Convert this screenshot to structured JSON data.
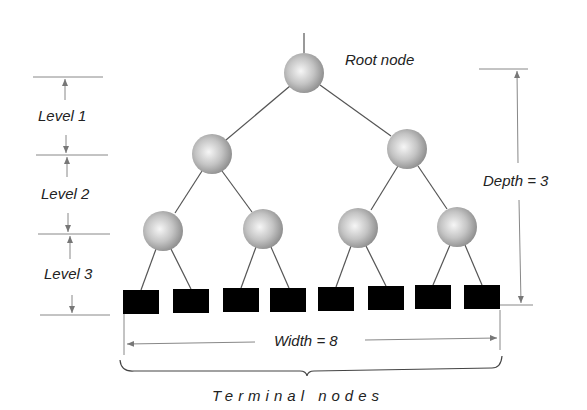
{
  "diagram": {
    "type": "binary-tree",
    "labels": {
      "root": "Root node",
      "level1": "Level 1",
      "level2": "Level 2",
      "level3": "Level 3",
      "depth": "Depth = 3",
      "width": "Width = 8",
      "terminal": "Terminal nodes"
    },
    "colors": {
      "line": "#555555",
      "node_fill_light": "#f4f4f4",
      "node_fill_dark": "#9a9a9a",
      "terminal_fill": "#000000",
      "guide": "#888888"
    },
    "nodes": [
      {
        "id": "root",
        "level": 0,
        "cx": 304,
        "cy": 73
      },
      {
        "id": "n1L",
        "level": 1,
        "cx": 212,
        "cy": 154
      },
      {
        "id": "n1R",
        "level": 1,
        "cx": 407,
        "cy": 149
      },
      {
        "id": "n2a",
        "level": 2,
        "cx": 163,
        "cy": 231
      },
      {
        "id": "n2b",
        "level": 2,
        "cx": 263,
        "cy": 229
      },
      {
        "id": "n2c",
        "level": 2,
        "cx": 358,
        "cy": 228
      },
      {
        "id": "n2d",
        "level": 2,
        "cx": 457,
        "cy": 227
      }
    ],
    "terminal_nodes": [
      {
        "x": 123,
        "y": 290
      },
      {
        "x": 173,
        "y": 289
      },
      {
        "x": 223,
        "y": 288
      },
      {
        "x": 270,
        "y": 288
      },
      {
        "x": 318,
        "y": 287
      },
      {
        "x": 368,
        "y": 286
      },
      {
        "x": 415,
        "y": 285
      },
      {
        "x": 464,
        "y": 285
      }
    ],
    "depth": 3,
    "width": 8
  }
}
